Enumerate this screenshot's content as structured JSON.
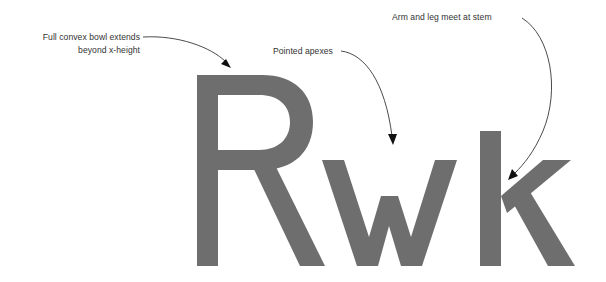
{
  "canvas": {
    "width": 606,
    "height": 282,
    "background": "#ffffff"
  },
  "specimen": {
    "name": "letterform-specimen",
    "text": "Rwk",
    "glyph_color": "#6e6e6e",
    "glyphs": [
      {
        "char": "R",
        "description": "capital R with full convex bowl and straight diagonal leg"
      },
      {
        "char": "w",
        "description": "lowercase w with pointed apexes"
      },
      {
        "char": "k",
        "description": "lowercase k with arm and leg meeting at the stem"
      }
    ],
    "metrics": {
      "cap_top_y": 75,
      "x_height_top_y": 160,
      "baseline_y": 266
    }
  },
  "annotations": {
    "text_color": "#333333",
    "line_color": "#2b2b2b",
    "items": [
      {
        "id": "bowl",
        "line1": "Full convex bowl extends",
        "line2": "beyond x-height",
        "target": "R bowl top",
        "arrow": "curved-down-right"
      },
      {
        "id": "apexes",
        "line1": "Pointed apexes",
        "line2": "",
        "target": "w middle apex",
        "arrow": "curved-down"
      },
      {
        "id": "arm",
        "line1": "Arm and leg meet at stem",
        "line2": "",
        "target": "k stem junction",
        "arrow": "curved-down-left"
      }
    ]
  }
}
